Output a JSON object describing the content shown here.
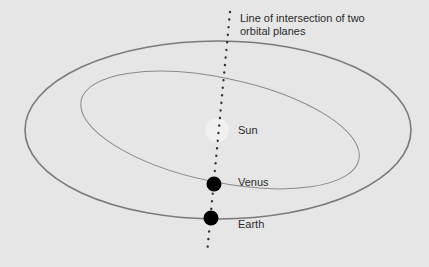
{
  "diagram": {
    "caption_line1": "Line of intersection of two",
    "caption_line2": "orbital planes",
    "labels": {
      "sun": "Sun",
      "venus": "Venus",
      "earth": "Earth"
    },
    "colors": {
      "background": "#e6e6e6",
      "orbit": "#7a7a7a",
      "planet": "#000000",
      "sun": "#efefef",
      "dots": "#333333"
    }
  }
}
